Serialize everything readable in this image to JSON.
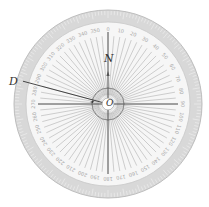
{
  "diagram": {
    "center": {
      "x": 108,
      "y": 104
    },
    "outer_radius": 94,
    "band_inner_radius": 82,
    "label_radius": 74,
    "inner_circle_radius": 6,
    "arc_radius": 16,
    "radial_line_step_deg": 5,
    "degree_label_step_deg": 10,
    "colors": {
      "band": "#d8d8d8",
      "face": "#f6f6f6",
      "lines": "#b0b0b0",
      "axes": "#333333",
      "labels": "#a8a8a8"
    },
    "labels": {
      "north": "N",
      "point_d": "D",
      "center_o": "O"
    },
    "degree_labels": [
      "0",
      "10",
      "20",
      "30",
      "40",
      "50",
      "60",
      "70",
      "80",
      "90",
      "100",
      "110",
      "120",
      "130",
      "140",
      "150",
      "160",
      "170",
      "180",
      "190",
      "200",
      "210",
      "220",
      "230",
      "240",
      "250",
      "260",
      "270",
      "280",
      "290",
      "300",
      "310",
      "320",
      "330",
      "340",
      "350"
    ],
    "direction_d_bearing_deg": 285
  }
}
